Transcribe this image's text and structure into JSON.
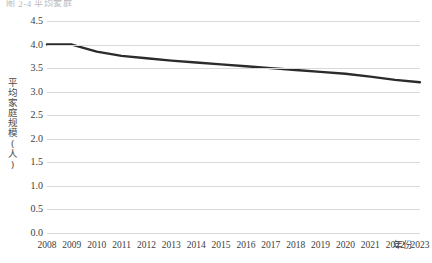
{
  "caption_fragment": "图 2-4  平均家庭",
  "chart_data": {
    "type": "line",
    "title": "",
    "xlabel": "年份",
    "ylabel": "平均家庭规模(人)",
    "x": [
      2008,
      2009,
      2010,
      2011,
      2012,
      2013,
      2014,
      2015,
      2016,
      2017,
      2018,
      2019,
      2020,
      2021,
      2022,
      2023
    ],
    "categories": [
      "2008",
      "2009",
      "2010",
      "2011",
      "2012",
      "2013",
      "2014",
      "2015",
      "2016",
      "2017",
      "2018",
      "2019",
      "2020",
      "2021",
      "2022",
      "2023"
    ],
    "values": [
      4.0,
      4.0,
      3.85,
      3.76,
      3.71,
      3.66,
      3.62,
      3.58,
      3.54,
      3.5,
      3.46,
      3.42,
      3.38,
      3.32,
      3.25,
      3.2
    ],
    "series": [
      {
        "name": "平均家庭规模(人)",
        "values": [
          4.0,
          4.0,
          3.85,
          3.76,
          3.71,
          3.66,
          3.62,
          3.58,
          3.54,
          3.5,
          3.46,
          3.42,
          3.38,
          3.32,
          3.25,
          3.2
        ],
        "color": "#2b2b2b"
      }
    ],
    "ylim": [
      0.0,
      4.5
    ],
    "ytick_labels": [
      "4.5",
      "4.0",
      "3.5",
      "3.0",
      "2.5",
      "2.0",
      "1.5",
      "1.0",
      "0.5",
      "0.0"
    ],
    "ytick_values": [
      4.5,
      4.0,
      3.5,
      3.0,
      2.5,
      2.0,
      1.5,
      1.0,
      0.5,
      0.0
    ],
    "grid": true,
    "grid_color": "#d9d9d9",
    "legend": "none",
    "line_color": "#2b2b2b",
    "line_width": 2.4,
    "markers": false
  }
}
